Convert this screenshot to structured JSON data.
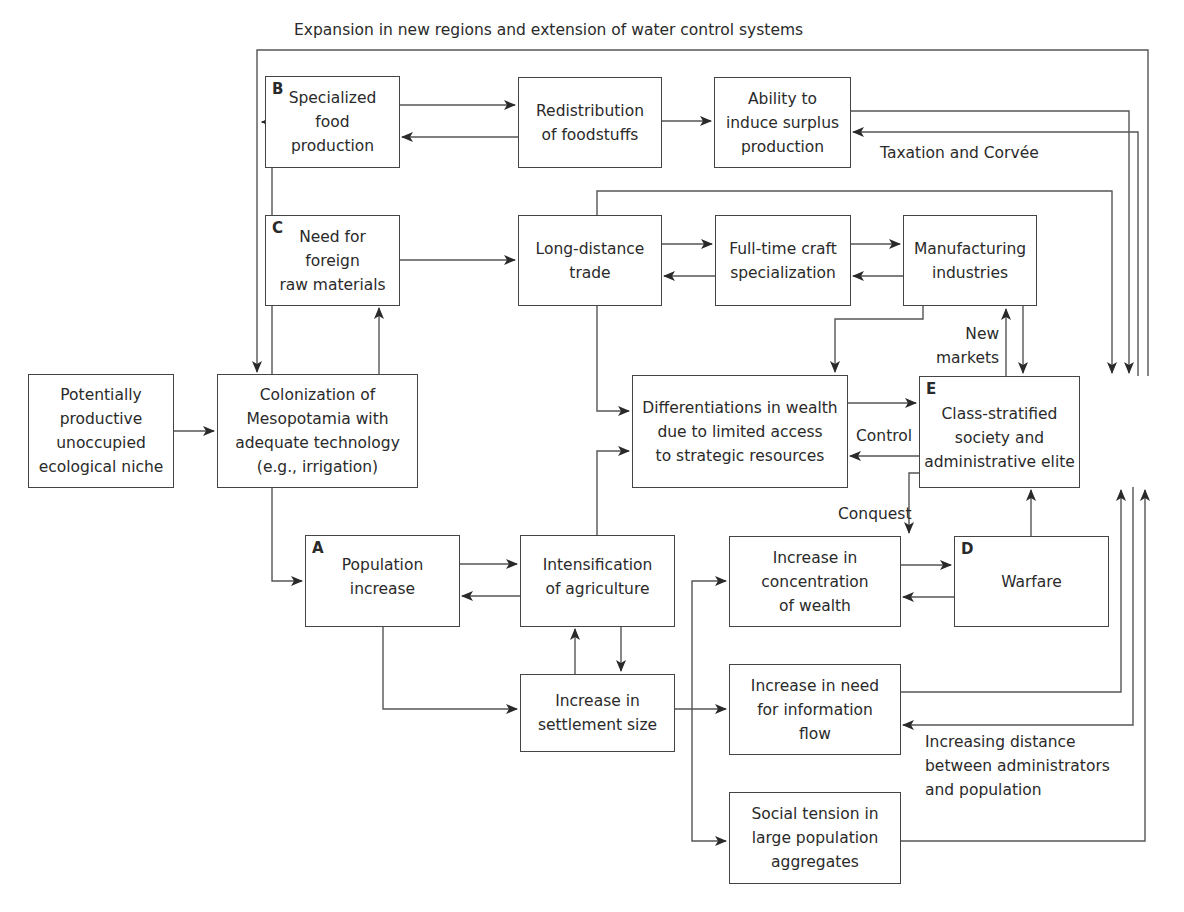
{
  "diagram": {
    "type": "flowchart",
    "title": "",
    "colors": {
      "line": "#444444",
      "text": "#2a2a2a",
      "background": "#ffffff"
    },
    "nodes": [
      {
        "id": "niche",
        "tag": "",
        "text": "Potentially\nproductive\nunoccupied\necological niche"
      },
      {
        "id": "colonization",
        "tag": "",
        "text": "Colonization of\nMesopotamia with\nadequate technology\n(e.g., irrigation)"
      },
      {
        "id": "specialized_food",
        "tag": "B",
        "text": "Specialized\nfood\nproduction"
      },
      {
        "id": "redistribution",
        "tag": "",
        "text": "Redistribution\nof foodstuffs"
      },
      {
        "id": "surplus",
        "tag": "",
        "text": "Ability to\ninduce surplus\nproduction"
      },
      {
        "id": "foreign_raw",
        "tag": "C",
        "text": "Need for\nforeign\nraw materials"
      },
      {
        "id": "long_distance",
        "tag": "",
        "text": "Long-distance\ntrade"
      },
      {
        "id": "craft",
        "tag": "",
        "text": "Full-time craft\nspecialization"
      },
      {
        "id": "manufacturing",
        "tag": "",
        "text": "Manufacturing\nindustries"
      },
      {
        "id": "differentiation",
        "tag": "",
        "text": "Differentiations in wealth\ndue to limited access\nto strategic resources"
      },
      {
        "id": "elite",
        "tag": "E",
        "text": "Class-stratified\nsociety and\nadministrative elite"
      },
      {
        "id": "population",
        "tag": "A",
        "text": "Population\nincrease"
      },
      {
        "id": "intensification",
        "tag": "",
        "text": "Intensification\nof agriculture"
      },
      {
        "id": "settlement",
        "tag": "",
        "text": "Increase in\nsettlement size"
      },
      {
        "id": "concentration",
        "tag": "",
        "text": "Increase in\nconcentration\nof wealth"
      },
      {
        "id": "warfare",
        "tag": "D",
        "text": "Warfare"
      },
      {
        "id": "information",
        "tag": "",
        "text": "Increase in need\nfor information\nflow"
      },
      {
        "id": "tension",
        "tag": "",
        "text": "Social tension in\nlarge population\naggregates"
      }
    ],
    "edge_labels": {
      "expansion": "Expansion in new regions and extension of water control systems",
      "taxation": "Taxation and Corvée",
      "new_markets": "New\nmarkets",
      "control": "Control",
      "conquest": "Conquest",
      "distance": "Increasing distance\nbetween administrators\nand population"
    },
    "edges": [
      {
        "from": "niche",
        "to": "colonization"
      },
      {
        "from": "colonization",
        "to": "specialized_food"
      },
      {
        "from": "colonization",
        "to": "foreign_raw"
      },
      {
        "from": "colonization",
        "to": "population"
      },
      {
        "from": "specialized_food",
        "to": "redistribution"
      },
      {
        "from": "redistribution",
        "to": "specialized_food"
      },
      {
        "from": "redistribution",
        "to": "surplus"
      },
      {
        "from": "surplus",
        "to": "elite"
      },
      {
        "from": "elite",
        "to": "surplus",
        "label": "Taxation and Corvée"
      },
      {
        "from": "elite",
        "to": "colonization",
        "label": "Expansion in new regions and extension of water control systems"
      },
      {
        "from": "foreign_raw",
        "to": "long_distance"
      },
      {
        "from": "long_distance",
        "to": "craft"
      },
      {
        "from": "craft",
        "to": "long_distance"
      },
      {
        "from": "craft",
        "to": "manufacturing"
      },
      {
        "from": "manufacturing",
        "to": "craft"
      },
      {
        "from": "long_distance",
        "to": "elite"
      },
      {
        "from": "long_distance",
        "to": "differentiation"
      },
      {
        "from": "manufacturing",
        "to": "differentiation"
      },
      {
        "from": "manufacturing",
        "to": "elite"
      },
      {
        "from": "elite",
        "to": "manufacturing",
        "label": "New markets"
      },
      {
        "from": "differentiation",
        "to": "elite"
      },
      {
        "from": "elite",
        "to": "differentiation",
        "label": "Control"
      },
      {
        "from": "elite",
        "to": "warfare",
        "label": "Conquest"
      },
      {
        "from": "warfare",
        "to": "elite"
      },
      {
        "from": "population",
        "to": "intensification"
      },
      {
        "from": "intensification",
        "to": "population"
      },
      {
        "from": "intensification",
        "to": "differentiation"
      },
      {
        "from": "intensification",
        "to": "settlement"
      },
      {
        "from": "settlement",
        "to": "intensification"
      },
      {
        "from": "population",
        "to": "settlement"
      },
      {
        "from": "settlement",
        "to": "concentration"
      },
      {
        "from": "settlement",
        "to": "information"
      },
      {
        "from": "settlement",
        "to": "tension"
      },
      {
        "from": "concentration",
        "to": "warfare"
      },
      {
        "from": "warfare",
        "to": "concentration"
      },
      {
        "from": "information",
        "to": "elite"
      },
      {
        "from": "elite",
        "to": "information",
        "label": "Increasing distance between administrators and population"
      },
      {
        "from": "tension",
        "to": "elite"
      }
    ]
  }
}
